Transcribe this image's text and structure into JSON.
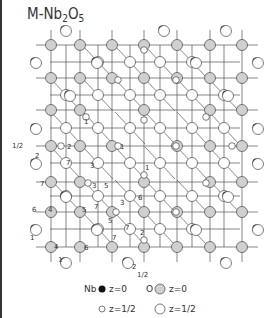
{
  "title": {
    "prefix": "M-Nb",
    "sub1": "2",
    "mid": "O",
    "sub2": "5"
  },
  "axis_labels": {
    "left": "1/2",
    "bottom": "1/2"
  },
  "legend": {
    "nb_label": "Nb",
    "o_label": "O",
    "z0": "z=0",
    "z_half": "z=1/2"
  },
  "colors": {
    "nb": "#111111",
    "o_z0": "#d0d0d0",
    "o_half": "#ffffff",
    "stroke": "#444444"
  },
  "site_labels": [
    "1",
    "2",
    "3",
    "4",
    "5",
    "6",
    "7"
  ]
}
